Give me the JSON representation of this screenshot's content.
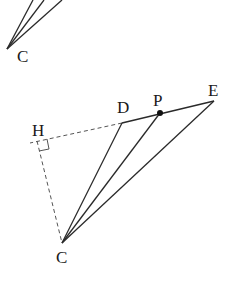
{
  "diagram": {
    "top_fragment": {
      "vertex_label": "C"
    },
    "main_figure": {
      "labels": {
        "H": "H",
        "D": "D",
        "P": "P",
        "E": "E",
        "C": "C"
      },
      "segments": [
        "CD",
        "CP",
        "CE",
        "DE"
      ],
      "dashed_segments": [
        "HD",
        "HC"
      ],
      "right_angle_at": "H"
    },
    "colors": {
      "line": "#2a2a2a",
      "dashed": "#555555",
      "background": "#ffffff"
    }
  }
}
